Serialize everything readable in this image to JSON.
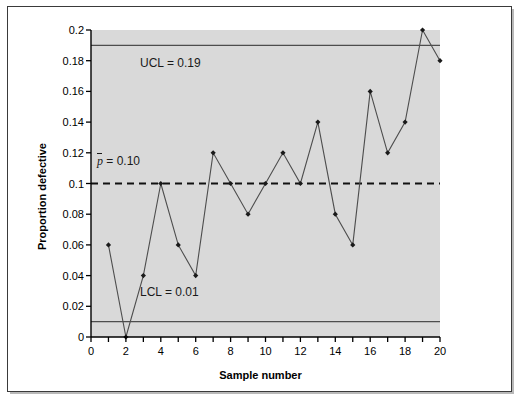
{
  "chart_data": {
    "type": "line",
    "title": "",
    "xlabel": "Sample number",
    "ylabel": "Proportion defective",
    "x": [
      1,
      2,
      3,
      4,
      5,
      6,
      7,
      8,
      9,
      10,
      11,
      12,
      13,
      14,
      15,
      16,
      17,
      18,
      19,
      20
    ],
    "values": [
      0.06,
      0.0,
      0.04,
      0.1,
      0.06,
      0.04,
      0.12,
      0.1,
      0.08,
      0.1,
      0.12,
      0.1,
      0.14,
      0.08,
      0.06,
      0.16,
      0.12,
      0.14,
      0.2,
      0.18
    ],
    "series": [
      {
        "name": "Proportion defective",
        "values": [
          0.06,
          0.0,
          0.04,
          0.1,
          0.06,
          0.04,
          0.12,
          0.1,
          0.08,
          0.1,
          0.12,
          0.1,
          0.14,
          0.08,
          0.06,
          0.16,
          0.12,
          0.14,
          0.2,
          0.18
        ]
      }
    ],
    "xlim": [
      0,
      20
    ],
    "ylim": [
      0,
      0.2
    ],
    "grid": false,
    "legend": false,
    "x_tick_labels": [
      "0",
      "2",
      "4",
      "6",
      "8",
      "10",
      "12",
      "14",
      "16",
      "18",
      "20"
    ],
    "x_tick_values": [
      0,
      2,
      4,
      6,
      8,
      10,
      12,
      14,
      16,
      18,
      20
    ],
    "x_minor_tick_values": [
      1,
      3,
      5,
      7,
      9,
      11,
      13,
      15,
      17,
      19
    ],
    "y_tick_labels": [
      "0",
      "0.02",
      "0.04",
      "0.06",
      "0.08",
      "0.1",
      "0.12",
      "0.14",
      "0.16",
      "0.18",
      "0.2"
    ],
    "y_tick_values": [
      0,
      0.02,
      0.04,
      0.06,
      0.08,
      0.1,
      0.12,
      0.14,
      0.16,
      0.18,
      0.2
    ],
    "control_limits": {
      "ucl": {
        "label": "UCL = 0.19",
        "value": 0.19,
        "style": "solid"
      },
      "center": {
        "label_prefix": "p",
        "label_suffix": " = 0.10",
        "value": 0.1,
        "style": "dashed"
      },
      "lcl": {
        "label": "LCL = 0.01",
        "value": 0.01,
        "style": "solid"
      }
    },
    "colors": {
      "plot_background": "#d9d9d9",
      "series_line": "#4d4d4d",
      "marker": "#1a1a1a",
      "limit_line": "#4d4d4d",
      "axis": "#000000",
      "figure_background": "#ffffff"
    },
    "marker_shape": "diamond"
  }
}
